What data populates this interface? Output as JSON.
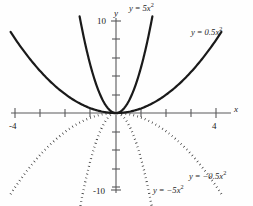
{
  "figure": {
    "title": "",
    "background_color": "#fefefe",
    "axis_color": "#58585a",
    "curve_color": "#1a1a1a"
  },
  "axes": {
    "x_axis_label": "x",
    "y_axis_label": "y",
    "x_tick_labels": [
      "-4",
      "4"
    ],
    "y_tick_labels": [
      "10",
      "-10"
    ],
    "x_min": -4.6,
    "x_max": 4.6,
    "y_min": -11.5,
    "y_max": 11.5
  },
  "labels": {
    "curve_5x2": {
      "lhs": "y",
      "op": "=",
      "coef": "5x",
      "exp": "2"
    },
    "curve_05x2": {
      "lhs": "y",
      "op": "=",
      "coef": "0.5x",
      "exp": "2"
    },
    "curve_neg5x2": {
      "lhs": "y",
      "op": "=",
      "coef": "−5x",
      "exp": "2"
    },
    "curve_neg05x2": {
      "lhs": "y",
      "op": "=",
      "coef": "−0.5x",
      "exp": "2"
    }
  },
  "chart_data": {
    "type": "line",
    "xlabel": "x",
    "ylabel": "y",
    "xlim": [
      -4.6,
      4.6
    ],
    "ylim": [
      -11.5,
      11.5
    ],
    "xticks": [
      -4,
      -3,
      -2,
      -1,
      0,
      1,
      2,
      3,
      4
    ],
    "yticks": [
      -10,
      -8,
      -6,
      -4,
      -2,
      0,
      2,
      4,
      6,
      8,
      10
    ],
    "xtick_labels": {
      "-4": "-4",
      "4": "4"
    },
    "ytick_labels": {
      "10": "10",
      "-10": "-10"
    },
    "grid": false,
    "legend": "inline-annotations",
    "series": [
      {
        "name": "y = 5x²",
        "equation": "y = 5*x^2",
        "coefficient": 5,
        "style": "solid",
        "color": "#1a1a1a",
        "x": [
          -1.45,
          -1.2,
          -1.0,
          -0.8,
          -0.6,
          -0.4,
          -0.2,
          0,
          0.2,
          0.4,
          0.6,
          0.8,
          1.0,
          1.2,
          1.45
        ],
        "y": [
          10.5,
          7.2,
          5.0,
          3.2,
          1.8,
          0.8,
          0.2,
          0,
          0.2,
          0.8,
          1.8,
          3.2,
          5.0,
          7.2,
          10.5
        ]
      },
      {
        "name": "y = 0.5x²",
        "equation": "y = 0.5*x^2",
        "coefficient": 0.5,
        "style": "solid",
        "color": "#1a1a1a",
        "x": [
          -4.2,
          -3.5,
          -3.0,
          -2.5,
          -2.0,
          -1.5,
          -1.0,
          -0.5,
          0,
          0.5,
          1.0,
          1.5,
          2.0,
          2.5,
          3.0,
          3.5,
          4.2
        ],
        "y": [
          8.8,
          6.1,
          4.5,
          3.1,
          2.0,
          1.1,
          0.5,
          0.1,
          0,
          0.1,
          0.5,
          1.1,
          2.0,
          3.1,
          4.5,
          6.1,
          8.8
        ]
      },
      {
        "name": "y = −5x²",
        "equation": "y = -5*x^2",
        "coefficient": -5,
        "style": "dotted",
        "color": "#1a1a1a",
        "x": [
          -1.45,
          -1.2,
          -1.0,
          -0.8,
          -0.6,
          -0.4,
          -0.2,
          0,
          0.2,
          0.4,
          0.6,
          0.8,
          1.0,
          1.2,
          1.45
        ],
        "y": [
          -10.5,
          -7.2,
          -5.0,
          -3.2,
          -1.8,
          -0.8,
          -0.2,
          0,
          -0.2,
          -0.8,
          -1.8,
          -3.2,
          -5.0,
          -7.2,
          -10.5
        ]
      },
      {
        "name": "y = −0.5x²",
        "equation": "y = -0.5*x^2",
        "coefficient": -0.5,
        "style": "dotted",
        "color": "#1a1a1a",
        "x": [
          -4.2,
          -3.5,
          -3.0,
          -2.5,
          -2.0,
          -1.5,
          -1.0,
          -0.5,
          0,
          0.5,
          1.0,
          1.5,
          2.0,
          2.5,
          3.0,
          3.5,
          4.2
        ],
        "y": [
          -8.8,
          -6.1,
          -4.5,
          -3.1,
          -2.0,
          -1.1,
          -0.5,
          -0.1,
          0,
          -0.1,
          -0.5,
          -1.1,
          -2.0,
          -3.1,
          -4.5,
          -6.1,
          -8.8
        ]
      }
    ],
    "annotations": [
      {
        "text": "y = 5x²",
        "x": 0.9,
        "y": 10.6
      },
      {
        "text": "y = 0.5x²",
        "x": 3.4,
        "y": 9.0
      },
      {
        "text": "y = −5x²",
        "x": 1.9,
        "y": -10.6
      },
      {
        "text": "y = −0.5x²",
        "x": 3.5,
        "y": -9.3
      }
    ]
  }
}
